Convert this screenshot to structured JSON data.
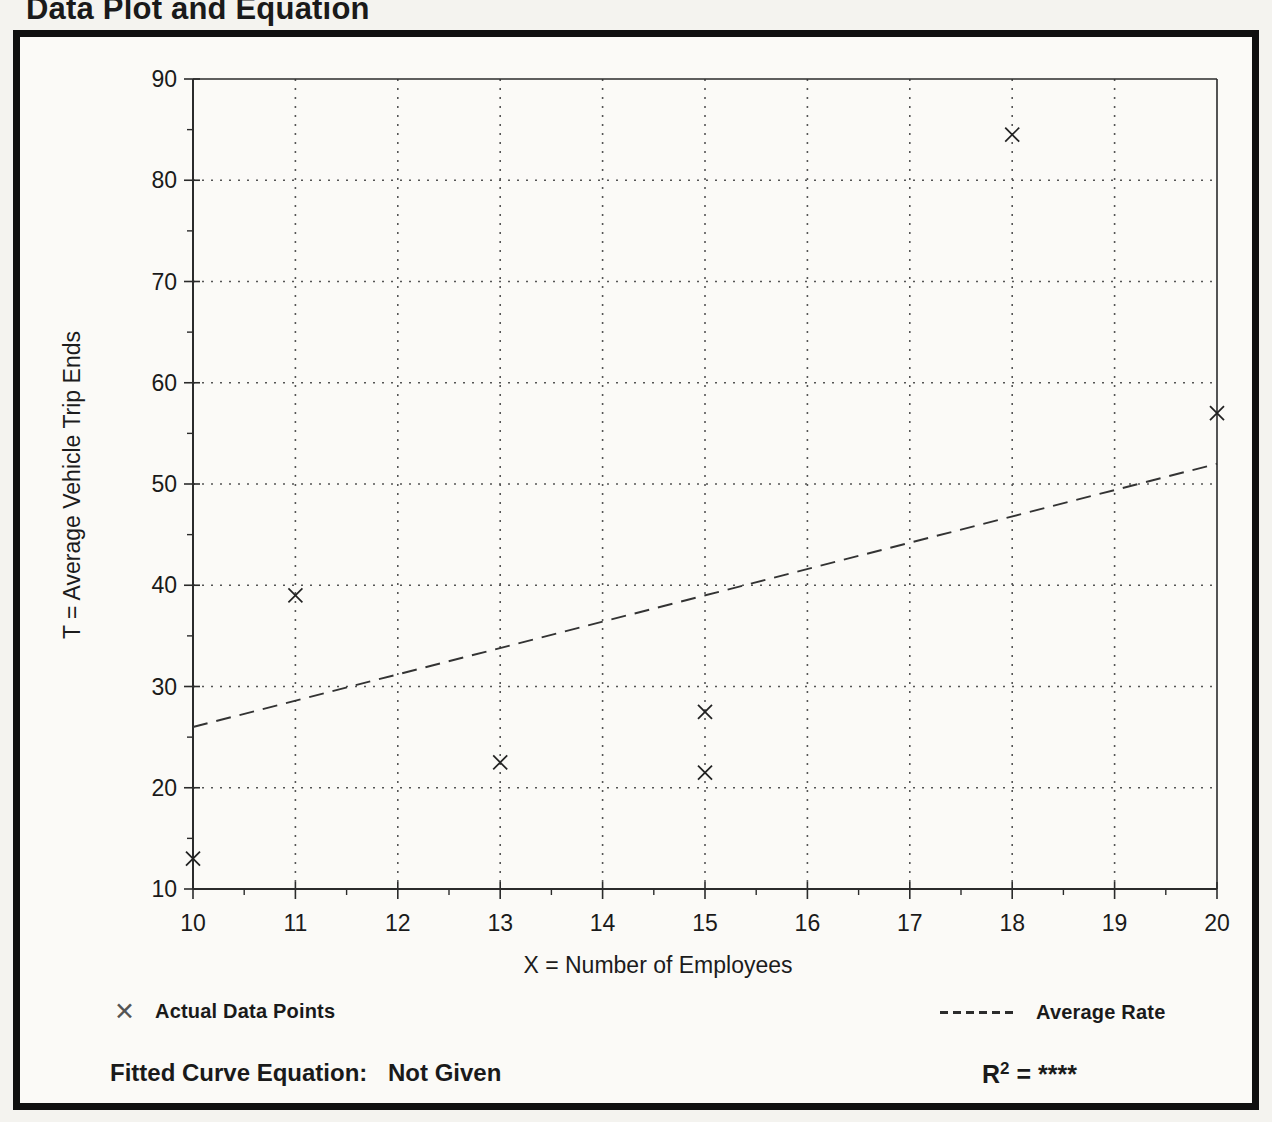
{
  "page_title": "Data Plot and Equation",
  "colors": {
    "ink": "#1a1a1a",
    "axis": "#2b2b2b",
    "grid": "#555555",
    "marker": "#222222",
    "rate_line": "#333333",
    "paper": "#fbfaf7",
    "page_background": "#f4f3ef"
  },
  "chart_data": {
    "type": "scatter",
    "title": "Data Plot and Equation",
    "xlabel": "X = Number of Employees",
    "ylabel": "T = Average Vehicle Trip Ends",
    "xlim": [
      10,
      20
    ],
    "ylim": [
      10,
      90
    ],
    "x_major_ticks": [
      10,
      11,
      12,
      13,
      14,
      15,
      16,
      17,
      18,
      19,
      20
    ],
    "y_major_ticks": [
      10,
      20,
      30,
      40,
      50,
      60,
      70,
      80,
      90
    ],
    "x_minor_step": 0.5,
    "y_minor_step": 5,
    "grid": "dotted interior gridlines at every integer X and every 10 T",
    "legend_position": "below plot, left and right",
    "series": [
      {
        "name": "Actual Data Points",
        "marker": "x",
        "points": [
          [
            10,
            13
          ],
          [
            11,
            39
          ],
          [
            13,
            22.5
          ],
          [
            15,
            21.5
          ],
          [
            15,
            27.5
          ],
          [
            18,
            84.5
          ],
          [
            20,
            57
          ]
        ]
      },
      {
        "name": "Average Rate",
        "style": "dashed-line",
        "line": [
          [
            10,
            26
          ],
          [
            20,
            52
          ]
        ]
      }
    ]
  },
  "legend": {
    "points_label": "Actual Data Points",
    "rate_label": "Average Rate"
  },
  "footer": {
    "equation_label": "Fitted Curve Equation:",
    "equation_value": "Not Given",
    "r2_base": "R",
    "r2_exp": "2",
    "r2_rest": "= ****"
  },
  "icons": {
    "x_marker": "✕"
  }
}
